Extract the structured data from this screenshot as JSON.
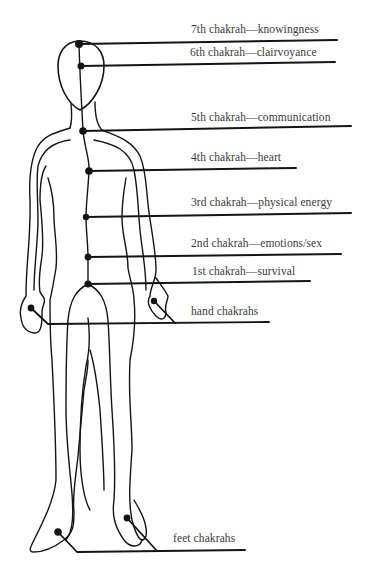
{
  "diagram": {
    "colors": {
      "ink": "#141414",
      "text": "#3a3a3a",
      "background": "#ffffff"
    },
    "chakras": [
      {
        "id": "7th",
        "label": "7th chakrah—knowingness"
      },
      {
        "id": "6th",
        "label": "6th chakrah—clairvoyance"
      },
      {
        "id": "5th",
        "label": "5th chakrah—communication"
      },
      {
        "id": "4th",
        "label": "4th chakrah—heart"
      },
      {
        "id": "3rd",
        "label": "3rd chakrah—physical energy"
      },
      {
        "id": "2nd",
        "label": "2nd chakrah—emotions/sex"
      },
      {
        "id": "1st",
        "label": "1st chakrah—survival"
      }
    ],
    "hand_label": "hand chakrahs",
    "feet_label": "feet chakrahs"
  }
}
